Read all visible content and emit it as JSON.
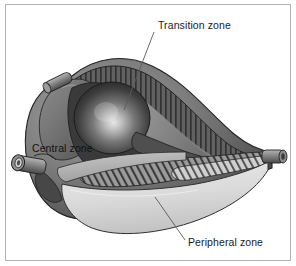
{
  "figure": {
    "kind": "anatomical-illustration",
    "style": "grayscale cutaway drawing",
    "border_color": "#b2b2b2",
    "background_color": "#ffffff"
  },
  "labels": {
    "transition": {
      "text": "Transition zone",
      "x": 158,
      "y": 29,
      "anchor": "start",
      "leader_from": [
        154,
        32
      ],
      "leader_to": [
        124,
        110
      ]
    },
    "central": {
      "text": "Central zone",
      "x": 32,
      "y": 152,
      "anchor": "start",
      "leader_from": null,
      "leader_to": null
    },
    "peripheral": {
      "text": "Peripheral zone",
      "x": 188,
      "y": 246,
      "anchor": "start",
      "leader_from": [
        185,
        240
      ],
      "leader_to": [
        155,
        197
      ]
    }
  },
  "palette": {
    "outline": "#2b2b2b",
    "capsule_dark": "#4a4a4a",
    "capsule_mid": "#6e6e6e",
    "capsule_light": "#9a9a9a",
    "transition_sphere_core": "#d8d8d8",
    "transition_sphere_edge": "#2e2e2e",
    "hatch_band_dark": "#585858",
    "hatch_band_mid": "#7d7d7d",
    "peripheral_light": "#dcdcdc",
    "peripheral_lighter": "#efefef",
    "leader_line": "#5a5a5a",
    "text": "#1b1b1b"
  },
  "structures": [
    {
      "name": "prostate-capsule",
      "description": "outer pear-shaped capsule body, shaded gray"
    },
    {
      "name": "transition-zone-sphere",
      "description": "central dark sphere with specular highlight"
    },
    {
      "name": "central-zone-wedge",
      "description": "mid gray wedge left of the sphere"
    },
    {
      "name": "upper-cut-surface",
      "description": "vertically hatched dark band across the top right"
    },
    {
      "name": "lower-cut-surface",
      "description": "diagonally hatched band across the lower middle"
    },
    {
      "name": "peripheral-zone-lobe",
      "description": "pale lower lobe of the gland"
    },
    {
      "name": "urethra-stub-right",
      "description": "short cylinder projecting at the right edge"
    },
    {
      "name": "duct-stub-upper-left",
      "description": "small tube projecting at the upper left"
    },
    {
      "name": "duct-stub-lower-left",
      "description": "ringed tube opening at the lower left"
    }
  ]
}
